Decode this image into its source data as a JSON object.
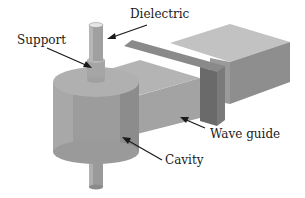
{
  "diagram": {
    "labels": {
      "dielectric": "Dielectric",
      "support": "Support",
      "wave_guide": "Wave guide",
      "cavity": "Cavity"
    },
    "colors": {
      "background": "#ffffff",
      "light_face": "#b8b8b8",
      "mid_face": "#9e9e9e",
      "dark_face": "#707070",
      "arrow": "#1a1a1a"
    }
  }
}
